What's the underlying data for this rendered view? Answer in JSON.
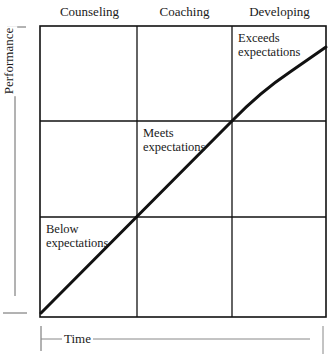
{
  "diagram": {
    "columns": [
      {
        "label": "Counseling"
      },
      {
        "label": "Coaching"
      },
      {
        "label": "Developing"
      }
    ],
    "cells": {
      "exceeds": "Exceeds\nexpectations",
      "meets": "Meets\nexpectations",
      "below": "Below\nexpectations"
    },
    "axes": {
      "y_label": "Performance",
      "x_label": "Time"
    },
    "grid": {
      "rows": 3,
      "cols": 3
    },
    "colors": {
      "line": "#111111",
      "axis": "#555555"
    }
  }
}
